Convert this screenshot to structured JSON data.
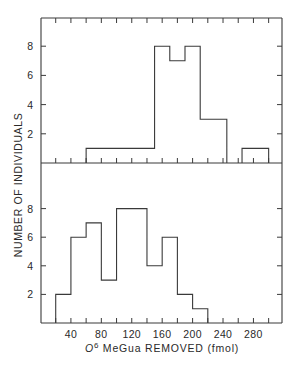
{
  "chart_data": [
    {
      "type": "bar",
      "subtype": "step-histogram",
      "panel": "top",
      "xlabel": "O6 MeGua REMOVED (fmol)",
      "ylabel": "NUMBER OF INDIVIDUALS",
      "yticks": [
        2,
        4,
        6,
        8
      ],
      "ylim": [
        0,
        10
      ],
      "xlim": [
        0,
        320
      ],
      "bins": [
        {
          "x0": 60,
          "x1": 150,
          "count": 1
        },
        {
          "x0": 150,
          "x1": 170,
          "count": 8
        },
        {
          "x0": 170,
          "x1": 190,
          "count": 7
        },
        {
          "x0": 190,
          "x1": 210,
          "count": 8
        },
        {
          "x0": 210,
          "x1": 245,
          "count": 3
        },
        {
          "x0": 265,
          "x1": 300,
          "count": 1
        }
      ]
    },
    {
      "type": "bar",
      "subtype": "step-histogram",
      "panel": "bottom",
      "xlabel": "O6 MeGua REMOVED (fmol)",
      "ylabel": "NUMBER OF INDIVIDUALS",
      "xticks": [
        40,
        80,
        120,
        160,
        200,
        240,
        280
      ],
      "yticks": [
        2,
        4,
        6,
        8
      ],
      "ylim": [
        0,
        10
      ],
      "xlim": [
        0,
        320
      ],
      "bins": [
        {
          "x0": 20,
          "x1": 40,
          "count": 2
        },
        {
          "x0": 40,
          "x1": 60,
          "count": 6
        },
        {
          "x0": 60,
          "x1": 80,
          "count": 7
        },
        {
          "x0": 80,
          "x1": 100,
          "count": 3
        },
        {
          "x0": 100,
          "x1": 140,
          "count": 8
        },
        {
          "x0": 140,
          "x1": 160,
          "count": 4
        },
        {
          "x0": 160,
          "x1": 180,
          "count": 6
        },
        {
          "x0": 180,
          "x1": 200,
          "count": 2
        },
        {
          "x0": 200,
          "x1": 220,
          "count": 1
        }
      ]
    }
  ],
  "labels": {
    "y_axis": "NUMBER OF INDIVIDUALS",
    "x_axis_prefix": "O",
    "x_axis_superscript": "6",
    "x_axis_rest": " MeGua REMOVED (fmol)"
  },
  "colors": {
    "line": "#3a3a3a",
    "background": "#ffffff"
  }
}
